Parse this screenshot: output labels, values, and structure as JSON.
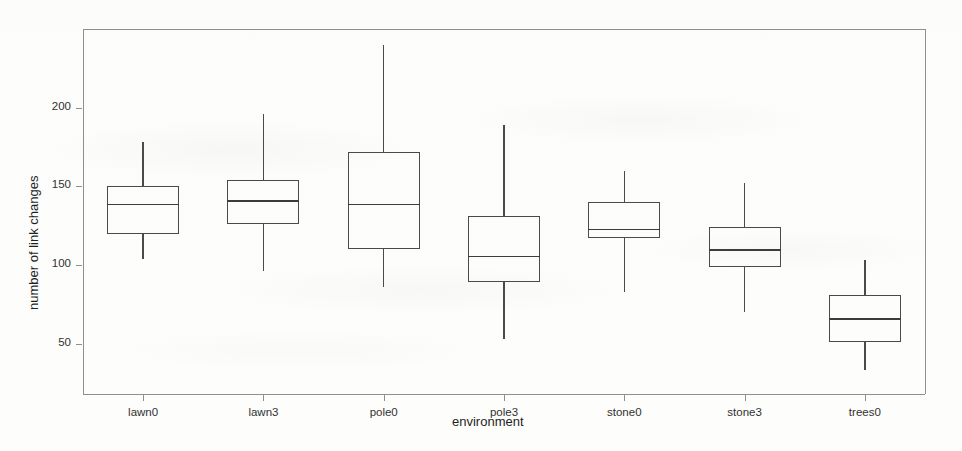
{
  "chart_data": {
    "type": "box",
    "title": "",
    "xlabel": "environment",
    "ylabel": "number of link changes",
    "categories": [
      "lawn0",
      "lawn3",
      "pole0",
      "pole3",
      "stone0",
      "stone3",
      "trees0"
    ],
    "ytick_values": [
      50,
      100,
      150,
      200
    ],
    "ytick_labels": [
      "50",
      "100",
      "150",
      "200"
    ],
    "ylim": [
      18,
      250
    ],
    "grid": false,
    "legend": null,
    "frame": "box",
    "boxes": [
      {
        "category": "lawn0",
        "whisker_low": 104,
        "q1": 120,
        "median": 139,
        "q3": 150,
        "whisker_high": 178
      },
      {
        "category": "lawn3",
        "whisker_low": 96,
        "q1": 126,
        "median": 141,
        "q3": 154,
        "whisker_high": 196
      },
      {
        "category": "pole0",
        "whisker_low": 86,
        "q1": 110,
        "median": 139,
        "q3": 172,
        "whisker_high": 240
      },
      {
        "category": "pole3",
        "whisker_low": 53,
        "q1": 89,
        "median": 106,
        "q3": 131,
        "whisker_high": 189
      },
      {
        "category": "stone0",
        "whisker_low": 83,
        "q1": 117,
        "median": 123,
        "q3": 140,
        "whisker_high": 160
      },
      {
        "category": "stone3",
        "whisker_low": 70,
        "q1": 99,
        "median": 110,
        "q3": 124,
        "whisker_high": 152
      },
      {
        "category": "trees0",
        "whisker_low": 33,
        "q1": 51,
        "median": 66,
        "q3": 81,
        "whisker_high": 103
      }
    ],
    "colors": {
      "line": "#4a4a4a",
      "frame": "#8f8f8f",
      "text": "#2a2a2a",
      "background": "#fdfdfc"
    }
  }
}
